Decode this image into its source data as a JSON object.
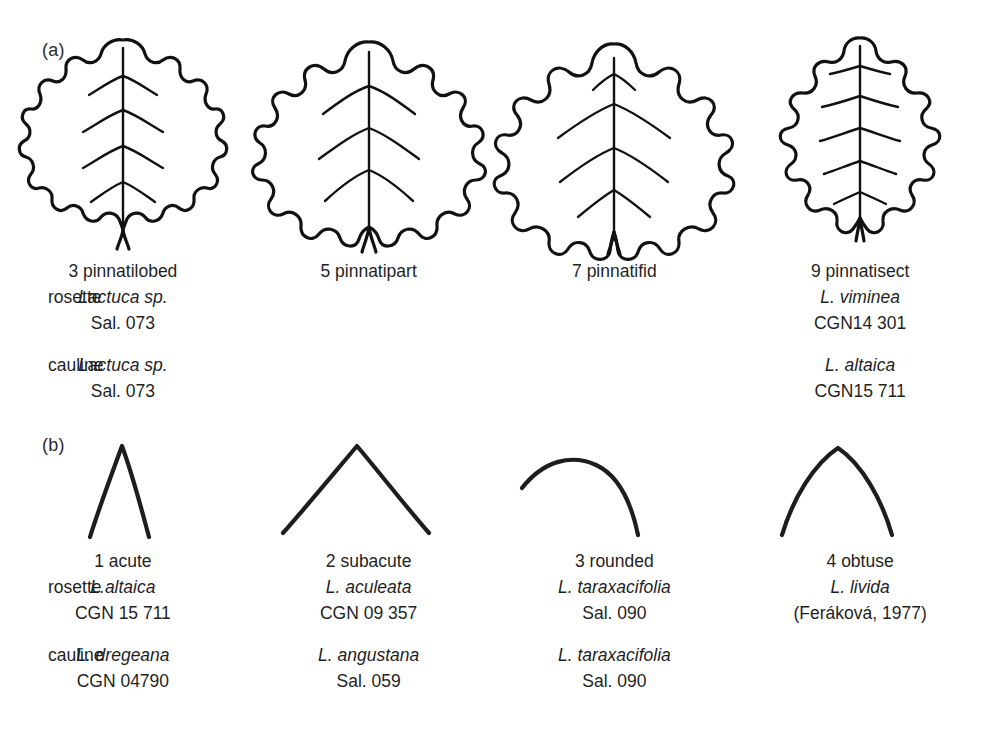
{
  "figure": {
    "panels": [
      {
        "label": "(a)",
        "trait": "leaf incision / blade division",
        "row_tags": {
          "rosette": "rosette",
          "cauline": "cauline"
        },
        "columns": [
          {
            "shape": "leaf-pinnatilobed",
            "state": "3 pinnatilobed",
            "rosette": {
              "taxon": "Lactuca sp.",
              "accession": "Sal. 073"
            },
            "cauline": {
              "taxon": "Lactuca sp.",
              "accession": "Sal. 073"
            }
          },
          {
            "shape": "leaf-pinnatipart",
            "state": "5 pinnatipart",
            "rosette": {
              "taxon": "",
              "accession": ""
            },
            "cauline": {
              "taxon": "",
              "accession": ""
            }
          },
          {
            "shape": "leaf-pinnatifid",
            "state": "7 pinnatifid",
            "rosette": {
              "taxon": "",
              "accession": ""
            },
            "cauline": {
              "taxon": "",
              "accession": ""
            }
          },
          {
            "shape": "leaf-pinnatisect",
            "state": "9 pinnatisect",
            "rosette": {
              "taxon": "L. viminea",
              "accession": "CGN14 301"
            },
            "cauline": {
              "taxon": "L. altaica",
              "accession": "CGN15 711"
            }
          }
        ]
      },
      {
        "label": "(b)",
        "trait": "leaf apex shape",
        "row_tags": {
          "rosette": "rosette",
          "cauline": "cauline"
        },
        "columns": [
          {
            "shape": "apex-acute",
            "state": "1 acute",
            "rosette": {
              "taxon": "L.altaica",
              "accession": "CGN 15 711"
            },
            "cauline": {
              "taxon": "L. dregeana",
              "accession": "CGN 04790"
            }
          },
          {
            "shape": "apex-subacute",
            "state": "2 subacute",
            "rosette": {
              "taxon": "L. aculeata",
              "accession": "CGN 09 357"
            },
            "cauline": {
              "taxon": "L. angustana",
              "accession": "Sal. 059"
            }
          },
          {
            "shape": "apex-rounded",
            "state": "3 rounded",
            "rosette": {
              "taxon": "L. taraxacifolia",
              "accession": "Sal. 090"
            },
            "cauline": {
              "taxon": "L. taraxacifolia",
              "accession": "Sal. 090"
            }
          },
          {
            "shape": "apex-obtuse",
            "state": "4 obtuse",
            "rosette": {
              "taxon": "L. livida",
              "accession": "(Feráková, 1977)"
            },
            "cauline": {
              "taxon": "",
              "accession": ""
            }
          }
        ]
      }
    ],
    "colors": {
      "ink": "#111111",
      "text": "#1f1f1f",
      "background": "#ffffff"
    }
  }
}
